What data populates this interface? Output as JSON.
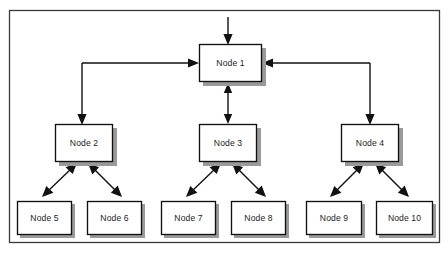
{
  "diagram": {
    "frame": {
      "name": "outer-border",
      "x": 9,
      "y": 10,
      "width": 431,
      "height": 233,
      "color": "#3a3a3a"
    },
    "style": {
      "node_fill": "#ffffff",
      "node_stroke": "#111111",
      "shadow_color": "#9a9a9a",
      "text_color": "#1d1d1d",
      "line_color": "#111111",
      "background": "#ffffff"
    },
    "nodes": [
      {
        "id": "node1",
        "label": "Node 1",
        "x": 199,
        "y": 44,
        "width": 63,
        "height": 38,
        "level": 1
      },
      {
        "id": "node2",
        "label": "Node 2",
        "x": 55,
        "y": 124,
        "width": 58,
        "height": 38,
        "level": 2
      },
      {
        "id": "node3",
        "label": "Node 3",
        "x": 199,
        "y": 124,
        "width": 58,
        "height": 38,
        "level": 2
      },
      {
        "id": "node4",
        "label": "Node 4",
        "x": 341,
        "y": 124,
        "width": 58,
        "height": 38,
        "level": 2
      },
      {
        "id": "node5",
        "label": "Node 5",
        "x": 17,
        "y": 201,
        "width": 55,
        "height": 34,
        "level": 3
      },
      {
        "id": "node6",
        "label": "Node 6",
        "x": 87,
        "y": 201,
        "width": 55,
        "height": 34,
        "level": 3
      },
      {
        "id": "node7",
        "label": "Node 7",
        "x": 161,
        "y": 201,
        "width": 55,
        "height": 34,
        "level": 3
      },
      {
        "id": "node8",
        "label": "Node 8",
        "x": 231,
        "y": 201,
        "width": 55,
        "height": 34,
        "level": 3
      },
      {
        "id": "node9",
        "label": "Node 9",
        "x": 306,
        "y": 201,
        "width": 56,
        "height": 34,
        "level": 3
      },
      {
        "id": "node10",
        "label": "Node 10",
        "x": 376,
        "y": 201,
        "width": 57,
        "height": 34,
        "level": 3
      }
    ],
    "connections": [
      {
        "id": "entry-to-node1",
        "name": "entry-arrow",
        "from": "external-input",
        "to": "node1",
        "direction": "one-way",
        "style": "straight-vertical"
      },
      {
        "id": "node2-to-node1",
        "name": "node2-node1-connector",
        "from": "node1",
        "to": "node2",
        "direction": "one-way-both-ends",
        "style": "orthogonal-left"
      },
      {
        "id": "node1-to-node3",
        "name": "node1-node3-connector",
        "from": "node1",
        "to": "node3",
        "direction": "two-way",
        "style": "straight-vertical"
      },
      {
        "id": "node4-to-node1",
        "name": "node4-node1-connector",
        "from": "node1",
        "to": "node4",
        "direction": "one-way-both-ends",
        "style": "orthogonal-right"
      },
      {
        "id": "node2-to-node5",
        "name": "node2-node5-connector",
        "from": "node2",
        "to": "node5",
        "direction": "two-way",
        "style": "diagonal"
      },
      {
        "id": "node2-to-node6",
        "name": "node2-node6-connector",
        "from": "node2",
        "to": "node6",
        "direction": "two-way",
        "style": "diagonal"
      },
      {
        "id": "node3-to-node7",
        "name": "node3-node7-connector",
        "from": "node3",
        "to": "node7",
        "direction": "two-way",
        "style": "diagonal"
      },
      {
        "id": "node3-to-node8",
        "name": "node3-node8-connector",
        "from": "node3",
        "to": "node8",
        "direction": "two-way",
        "style": "diagonal"
      },
      {
        "id": "node4-to-node9",
        "name": "node4-node9-connector",
        "from": "node4",
        "to": "node9",
        "direction": "two-way",
        "style": "diagonal"
      },
      {
        "id": "node4-to-node10",
        "name": "node4-node10-connector",
        "from": "node4",
        "to": "node10",
        "direction": "two-way",
        "style": "diagonal"
      }
    ]
  }
}
